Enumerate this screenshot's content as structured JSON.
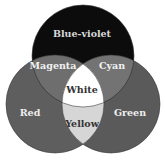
{
  "diagram": {
    "type": "venn",
    "title": "",
    "circles": [
      {
        "id": "top",
        "label": "Blue-violet",
        "color": "#0c0c0c",
        "cx": 83,
        "cy": 56,
        "r": 51
      },
      {
        "id": "left",
        "label": "Red",
        "color": "#5e5e5e",
        "cx": 55,
        "cy": 104,
        "r": 49
      },
      {
        "id": "right",
        "label": "Green",
        "color": "#5a5a5a",
        "cx": 111,
        "cy": 104,
        "r": 49
      }
    ],
    "regions": {
      "blue_violet": {
        "label": "Blue-violet",
        "color": "#0c0c0c",
        "text_color": "#d8d8d8"
      },
      "red": {
        "label": "Red",
        "color": "#5e5e5e",
        "text_color": "#eeeeee"
      },
      "green": {
        "label": "Green",
        "color": "#5a5a5a",
        "text_color": "#eeeeee"
      },
      "magenta": {
        "label": "Magenta",
        "color": "#6e6e6e",
        "text_color": "#f2f2f2"
      },
      "cyan": {
        "label": "Cyan",
        "color": "#737373",
        "text_color": "#f2f2f2"
      },
      "yellow": {
        "label": "Yellow",
        "color": "#d6d6d6",
        "text_color": "#333333"
      },
      "white": {
        "label": "White",
        "color": "#ffffff",
        "text_color": "#333333"
      }
    }
  }
}
